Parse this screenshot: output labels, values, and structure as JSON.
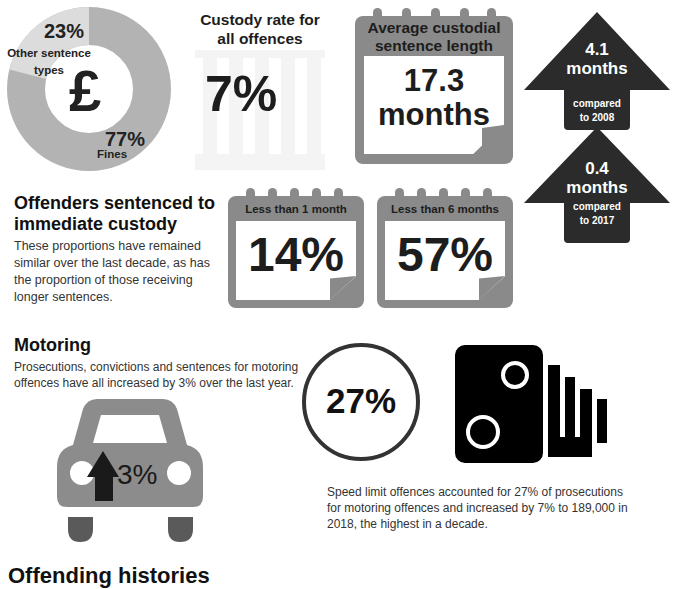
{
  "donut": {
    "icon": "pound-sign",
    "symbol": "£",
    "other_pct": "23%",
    "other_label_1": "Other sentence",
    "other_label_2": "types",
    "fines_pct": "77%",
    "fines_label": "Fines",
    "colors": {
      "fines": "#b3b3b3",
      "other": "#dcdcdc"
    }
  },
  "custody_rate": {
    "title_1": "Custody rate for",
    "title_2": "all offences",
    "value": "7%"
  },
  "avg_sentence": {
    "title_1": "Average custodial",
    "title_2": "sentence length",
    "value_1": "17.3",
    "value_2": "months"
  },
  "arrows": [
    {
      "value_1": "4.1",
      "value_2": "months",
      "note_1": "compared",
      "note_2": "to 2008"
    },
    {
      "value_1": "0.4",
      "value_2": "months",
      "note_1": "compared",
      "note_2": "to 2017"
    }
  ],
  "immediate_custody": {
    "title_1": "Offenders sentenced to",
    "title_2": "immediate custody",
    "body": [
      "These proportions have remained",
      "similar over the last decade, as has",
      "the proportion of those receiving",
      "longer sentences."
    ],
    "cards": [
      {
        "label": "Less than 1 month",
        "value": "14%"
      },
      {
        "label": "Less than 6 months",
        "value": "57%"
      }
    ]
  },
  "motoring": {
    "title": "Motoring",
    "body": [
      "Prosecutions, convictions and sentences for motoring",
      "offences have all increased by 3% over the last year."
    ],
    "car_value": "3%",
    "circle_value": "27%",
    "speed_text": [
      "Speed limit offences accounted for 27% of prosecutions",
      "for motoring offences and increased by 7% to 189,000 in",
      "2018, the highest in a decade."
    ]
  },
  "next_section": {
    "title": "Offending histories"
  }
}
